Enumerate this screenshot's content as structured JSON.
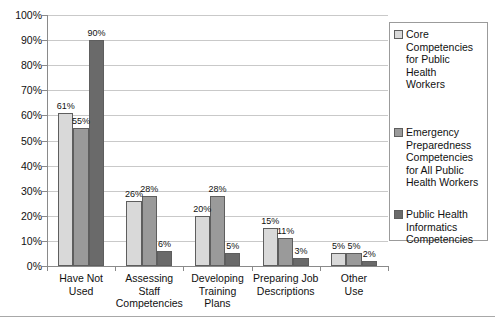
{
  "chart_data": {
    "type": "bar",
    "title": "",
    "subtitle": "",
    "xlabel": "",
    "ylabel": "",
    "ylim": [
      0,
      100
    ],
    "ytick_labels": [
      "0%",
      "10%",
      "20%",
      "30%",
      "40%",
      "50%",
      "60%",
      "70%",
      "80%",
      "90%",
      "100%"
    ],
    "ytick_values": [
      0,
      10,
      20,
      30,
      40,
      50,
      60,
      70,
      80,
      90,
      100
    ],
    "grid": "horizontal",
    "legend_position": "right",
    "value_suffix": "%",
    "categories": [
      "Have Not Used",
      "Assessing Staff Competencies",
      "Developing Training Plans",
      "Preparing Job Descriptions",
      "Other Use"
    ],
    "category_lines": [
      [
        "Have Not",
        "Used"
      ],
      [
        "Assessing",
        "Staff",
        "Competencies"
      ],
      [
        "Developing",
        "Training",
        "Plans"
      ],
      [
        "Preparing Job",
        "Descriptions"
      ],
      [
        "Other",
        "Use"
      ]
    ],
    "series": [
      {
        "name": "Core Competencies for Public Health Workers",
        "name_lines": [
          "Core",
          "Competencies",
          "for Public",
          "Health",
          "Workers"
        ],
        "color": "#d9d9d9",
        "values": [
          61,
          26,
          20,
          15,
          5
        ],
        "labels": [
          "61%",
          "26%",
          "20%",
          "15%",
          "5%"
        ]
      },
      {
        "name": "Emergency Preparedness Competencies for All Public Health Workers",
        "name_lines": [
          "Emergency",
          "Preparedness",
          "Competencies",
          "for All Public",
          "Health Workers"
        ],
        "color": "#9a9a9a",
        "values": [
          55,
          28,
          28,
          11,
          5
        ],
        "labels": [
          "55%",
          "28%",
          "28%",
          "11%",
          "5%"
        ]
      },
      {
        "name": "Public Health Informatics Competencies",
        "name_lines": [
          "Public Health",
          "Informatics",
          "Competencies"
        ],
        "color": "#6a6a6a",
        "values": [
          90,
          6,
          5,
          3,
          2
        ],
        "labels": [
          "90%",
          "6%",
          "5%",
          "3%",
          "2%"
        ]
      }
    ]
  },
  "colors": {
    "series_light": "#d9d9d9",
    "series_medium": "#9a9a9a",
    "series_dark": "#6a6a6a",
    "gridline": "#c9c9c9",
    "axis": "#8a8a8a",
    "text": "#111111",
    "background": "#ffffff"
  }
}
